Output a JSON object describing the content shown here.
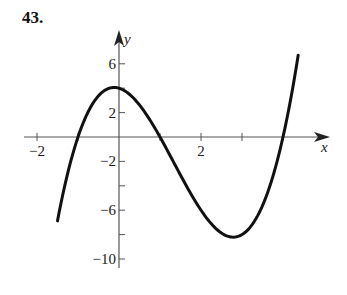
{
  "problem_number": "43.",
  "chart_data": {
    "type": "line",
    "title": "43.",
    "xlabel": "x",
    "ylabel": "y",
    "function": "f(x) = (x^2 - 1)(x - 4) = x^3 - 4x^2 - x + 4",
    "x_range_plotted": [
      -1.5,
      4.37
    ],
    "xlim": [
      -2.3,
      5.1
    ],
    "ylim": [
      -10.5,
      7.5
    ],
    "x_ticks": [
      -2,
      -1,
      0,
      1,
      2,
      3,
      4
    ],
    "x_tick_labels": [
      {
        "value": -2,
        "label": "−2"
      },
      {
        "value": 2,
        "label": "2"
      }
    ],
    "y_ticks": [
      -10,
      -8,
      -6,
      -4,
      -2,
      2,
      4,
      6
    ],
    "y_tick_labels": [
      {
        "value": 6,
        "label": "6"
      },
      {
        "value": 2,
        "label": "2"
      },
      {
        "value": -2,
        "label": "−2"
      },
      {
        "value": -6,
        "label": "−6"
      },
      {
        "value": -10,
        "label": "−10"
      }
    ],
    "key_points": {
      "x_intercepts": [
        -1,
        1,
        4
      ],
      "y_intercept": 4,
      "local_max": [
        0,
        4
      ],
      "local_min": [
        2.8,
        -8.2
      ],
      "left_end": [
        -1.5,
        -6.9
      ],
      "right_end": [
        4.37,
        6.1
      ]
    },
    "grid": false,
    "legend": null
  }
}
